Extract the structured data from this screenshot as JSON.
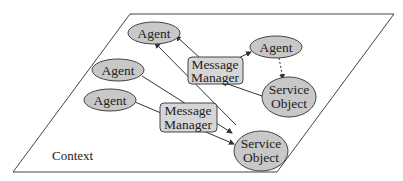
{
  "diagram": {
    "context_label": "Context",
    "colors": {
      "node_fill": "#c8c8c8",
      "box_fill": "#d6d6d6",
      "stroke": "#444444"
    },
    "nodes": [
      {
        "id": "agent1",
        "kind": "agent",
        "lines": [
          "Agent"
        ]
      },
      {
        "id": "agent2",
        "kind": "agent",
        "lines": [
          "Agent"
        ]
      },
      {
        "id": "agent3",
        "kind": "agent",
        "lines": [
          "Agent"
        ]
      },
      {
        "id": "agent4",
        "kind": "agent",
        "lines": [
          "Agent"
        ]
      },
      {
        "id": "mm1",
        "kind": "message-manager",
        "lines": [
          "Message",
          "Manager"
        ]
      },
      {
        "id": "mm2",
        "kind": "message-manager",
        "lines": [
          "Message",
          "Manager"
        ]
      },
      {
        "id": "so1",
        "kind": "service-object",
        "lines": [
          "Service",
          "Object"
        ]
      },
      {
        "id": "so2",
        "kind": "service-object",
        "lines": [
          "Service",
          "Object"
        ]
      }
    ],
    "edges": [
      {
        "from": "mm1",
        "to": "agent1",
        "style": "solid",
        "arrow": true
      },
      {
        "from": "mm1",
        "to": "agent2",
        "style": "solid",
        "arrow": true
      },
      {
        "from": "so1",
        "to": "agent1",
        "style": "solid",
        "arrow": true
      },
      {
        "from": "so1",
        "to": "mm1",
        "style": "solid",
        "arrow": true
      },
      {
        "from": "agent2",
        "to": "so1",
        "style": "dashed",
        "arrow": true
      },
      {
        "from": "agent3",
        "to": "so2",
        "style": "solid",
        "arrow": true
      },
      {
        "from": "agent4",
        "to": "so2",
        "style": "solid",
        "arrow": true
      }
    ]
  }
}
